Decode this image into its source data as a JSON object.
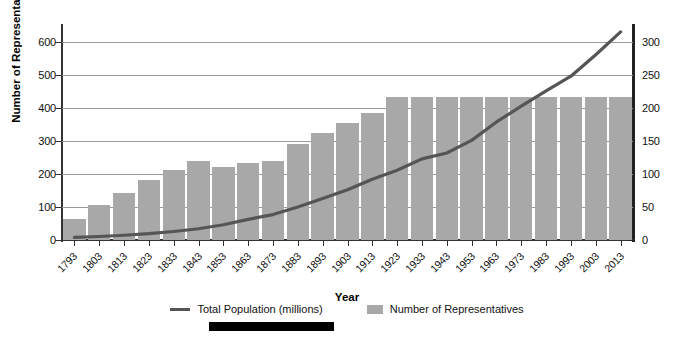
{
  "chart_data": {
    "type": "bar",
    "title": "",
    "xlabel": "Year",
    "ylabel": "Number of Representatives",
    "ylabel_secondary": "Population (millions)",
    "categories": [
      "1793",
      "1803",
      "1813",
      "1823",
      "1833",
      "1843",
      "1853",
      "1863",
      "1873",
      "1883",
      "1893",
      "1903",
      "1913",
      "1923",
      "1933",
      "1943",
      "1953",
      "1963",
      "1973",
      "1983",
      "1993",
      "2003",
      "2013"
    ],
    "ylim": [
      0,
      650
    ],
    "ylim_secondary": [
      0,
      325
    ],
    "yticks": [
      0,
      100,
      200,
      300,
      400,
      500,
      600
    ],
    "yticks_secondary": [
      0,
      50,
      100,
      150,
      200,
      250,
      300
    ],
    "grid": true,
    "legend_position": "bottom",
    "series": [
      {
        "name": "Number of Representatives",
        "type": "bar",
        "axis": "left",
        "color": "#a8a8a8",
        "values": [
          65,
          106,
          142,
          182,
          213,
          240,
          223,
          234,
          241,
          293,
          325,
          356,
          386,
          435,
          435,
          435,
          435,
          435,
          435,
          435,
          435,
          435,
          435
        ]
      },
      {
        "name": "Total Population (millions)",
        "type": "line",
        "axis": "right",
        "color": "#555555",
        "values": [
          3.9,
          5.3,
          7.2,
          9.6,
          12.9,
          17.1,
          23.2,
          31.4,
          38.6,
          50.2,
          62.9,
          76.2,
          92.2,
          106.0,
          123.2,
          132.2,
          151.3,
          179.3,
          203.2,
          226.5,
          248.7,
          281.4,
          316.1
        ]
      }
    ]
  },
  "legend": {
    "items": [
      {
        "label": "Total Population (millions)",
        "marker": "line"
      },
      {
        "label": "Number of Representatives",
        "marker": "swatch"
      }
    ]
  },
  "colors": {
    "bar": "#a8a8a8",
    "line": "#555555",
    "grid": "#9a9a9a",
    "axis": "#333333"
  }
}
